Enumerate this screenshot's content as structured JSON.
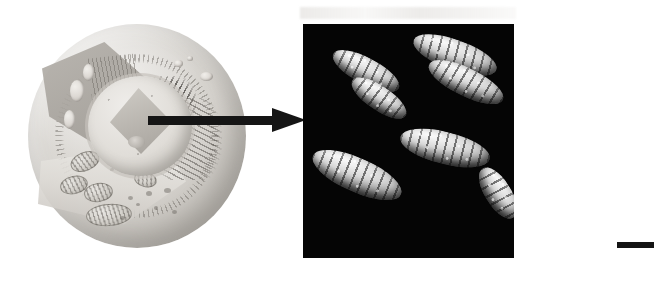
{
  "figure": {
    "background_color": "#ffffff",
    "width": 654,
    "height": 285
  },
  "cell_illustration": {
    "name": "animal-cell-cutaway",
    "description": "Grayscale pencil-style cutaway illustration of an animal cell",
    "style": "grayscale halftone illustration",
    "colors": {
      "membrane": "#a09c96",
      "cytoplasm": "#d6d3ce",
      "nucleus": "#e0ddd8",
      "organelle_outline": "#6e6a64"
    },
    "organelles": [
      {
        "name": "cell-membrane",
        "label": "Cell membrane"
      },
      {
        "name": "nucleus",
        "label": "Nucleus"
      },
      {
        "name": "nucleolus",
        "label": "Nucleolus"
      },
      {
        "name": "mitochondrion",
        "label": "Mitochondrion"
      },
      {
        "name": "rough-endoplasmic-reticulum",
        "label": "Rough endoplasmic reticulum"
      },
      {
        "name": "golgi-apparatus",
        "label": "Golgi apparatus"
      },
      {
        "name": "vesicle",
        "label": "Vesicle"
      },
      {
        "name": "cytoplasm",
        "label": "Cytoplasm"
      }
    ],
    "vesicles": [
      {
        "left": 150,
        "top": 40,
        "w": 9,
        "h": 7
      },
      {
        "left": 163,
        "top": 36,
        "w": 6,
        "h": 5
      },
      {
        "left": 176,
        "top": 52,
        "w": 13,
        "h": 9
      },
      {
        "left": 46,
        "top": 60,
        "w": 14,
        "h": 22
      },
      {
        "left": 40,
        "top": 90,
        "w": 11,
        "h": 19
      },
      {
        "left": 59,
        "top": 44,
        "w": 11,
        "h": 17
      }
    ],
    "mitochondria": [
      {
        "left": 46,
        "top": 132,
        "w": 28,
        "h": 17,
        "rot": -22
      },
      {
        "left": 36,
        "top": 156,
        "w": 26,
        "h": 16,
        "rot": -12
      },
      {
        "left": 60,
        "top": 163,
        "w": 27,
        "h": 17,
        "rot": -8
      },
      {
        "left": 62,
        "top": 184,
        "w": 44,
        "h": 20,
        "rot": -4
      },
      {
        "left": 110,
        "top": 152,
        "w": 21,
        "h": 13,
        "rot": 14
      }
    ],
    "granules": [
      {
        "left": 104,
        "top": 176,
        "w": 5,
        "h": 4
      },
      {
        "left": 112,
        "top": 183,
        "w": 4,
        "h": 3
      },
      {
        "left": 122,
        "top": 171,
        "w": 6,
        "h": 5
      },
      {
        "left": 130,
        "top": 186,
        "w": 4,
        "h": 4
      },
      {
        "left": 140,
        "top": 168,
        "w": 7,
        "h": 5
      },
      {
        "left": 96,
        "top": 196,
        "w": 5,
        "h": 4
      },
      {
        "left": 148,
        "top": 190,
        "w": 5,
        "h": 4
      },
      {
        "left": 86,
        "top": 148,
        "w": 4,
        "h": 3
      }
    ]
  },
  "arrow": {
    "name": "magnification-arrow",
    "direction": "right",
    "color": "#151515",
    "description": "Thick black arrow pointing from the cell nucleus to the chromosome micrograph"
  },
  "chromosome_panel": {
    "name": "chromosome-micrograph",
    "description": "Scanning electron micrograph of condensed metaphase chromosomes on a black field",
    "background_color": "#050505",
    "chromosome_color": "#e8e8e8",
    "count": 7,
    "chromosomes": [
      {
        "id": "chromosome-1",
        "left": 26,
        "top": 34,
        "w": 74,
        "h": 26,
        "rot": 28,
        "band": "88deg"
      },
      {
        "id": "chromosome-2",
        "left": 44,
        "top": 62,
        "w": 64,
        "h": 24,
        "rot": 34,
        "band": "92deg"
      },
      {
        "id": "chromosome-3",
        "left": 108,
        "top": 16,
        "w": 88,
        "h": 30,
        "rot": 20,
        "band": "85deg"
      },
      {
        "id": "chromosome-4",
        "left": 122,
        "top": 44,
        "w": 82,
        "h": 28,
        "rot": 26,
        "band": "95deg"
      },
      {
        "id": "chromosome-5",
        "left": 96,
        "top": 108,
        "w": 92,
        "h": 32,
        "rot": 14,
        "band": "90deg"
      },
      {
        "id": "chromosome-6",
        "left": 6,
        "top": 134,
        "w": 96,
        "h": 34,
        "rot": 24,
        "band": "88deg"
      },
      {
        "id": "chromosome-7",
        "left": 166,
        "top": 156,
        "w": 58,
        "h": 26,
        "rot": 58,
        "band": "94deg"
      }
    ]
  },
  "continuation_line": {
    "name": "figure-continuation-line",
    "color": "#141414",
    "description": "Short horizontal black rule running off the right edge of the figure"
  }
}
